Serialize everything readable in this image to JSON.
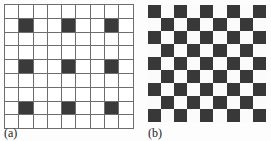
{
  "figure": {
    "background_color": "#fdfdfd",
    "panels": [
      {
        "id": "a",
        "caption": "(a)",
        "type": "sparse-grid",
        "rows": 9,
        "cols": 9,
        "gridlines": true,
        "gridline_color": "#6d6d6d",
        "cell_light_color": "#ffffff",
        "cell_dark_color": "#3a3a3a",
        "dark_cells_description": "dark squares at rows 2,5,8 and columns 2,5,8 (1-indexed)",
        "dark_rows": [
          2,
          5,
          8
        ],
        "dark_cols": [
          2,
          5,
          8
        ],
        "matrix": [
          [
            0,
            0,
            0,
            0,
            0,
            0,
            0,
            0,
            0
          ],
          [
            0,
            1,
            0,
            0,
            1,
            0,
            0,
            1,
            0
          ],
          [
            0,
            0,
            0,
            0,
            0,
            0,
            0,
            0,
            0
          ],
          [
            0,
            0,
            0,
            0,
            0,
            0,
            0,
            0,
            0
          ],
          [
            0,
            1,
            0,
            0,
            1,
            0,
            0,
            1,
            0
          ],
          [
            0,
            0,
            0,
            0,
            0,
            0,
            0,
            0,
            0
          ],
          [
            0,
            0,
            0,
            0,
            0,
            0,
            0,
            0,
            0
          ],
          [
            0,
            1,
            0,
            0,
            1,
            0,
            0,
            1,
            0
          ],
          [
            0,
            0,
            0,
            0,
            0,
            0,
            0,
            0,
            0
          ]
        ]
      },
      {
        "id": "b",
        "caption": "(b)",
        "type": "checkerboard",
        "rows": 9,
        "cols": 9,
        "gridlines": false,
        "cell_light_color": "#fbfbfb",
        "cell_dark_color": "#383838",
        "dark_cells_description": "full checkerboard, dark at top-left corner, alternating every cell",
        "matrix": [
          [
            1,
            0,
            1,
            0,
            1,
            0,
            1,
            0,
            1
          ],
          [
            0,
            1,
            0,
            1,
            0,
            1,
            0,
            1,
            0
          ],
          [
            1,
            0,
            1,
            0,
            1,
            0,
            1,
            0,
            1
          ],
          [
            0,
            1,
            0,
            1,
            0,
            1,
            0,
            1,
            0
          ],
          [
            1,
            0,
            1,
            0,
            1,
            0,
            1,
            0,
            1
          ],
          [
            0,
            1,
            0,
            1,
            0,
            1,
            0,
            1,
            0
          ],
          [
            1,
            0,
            1,
            0,
            1,
            0,
            1,
            0,
            1
          ],
          [
            0,
            1,
            0,
            1,
            0,
            1,
            0,
            1,
            0
          ],
          [
            1,
            0,
            1,
            0,
            1,
            0,
            1,
            0,
            1
          ]
        ]
      }
    ]
  }
}
